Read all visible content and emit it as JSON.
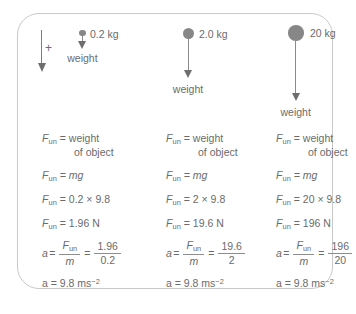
{
  "figure": {
    "direction_key": {
      "positive_symbol": "+"
    },
    "mass_groups": [
      {
        "id": "a",
        "mass_label": "0.2 kg",
        "weight_label": "weight"
      },
      {
        "id": "b",
        "mass_label": "2.0 kg",
        "weight_label": "weight"
      },
      {
        "id": "c",
        "mass_label": "20 kg",
        "weight_label": "weight"
      }
    ],
    "columns": [
      {
        "id": "a",
        "force_word_eq_lhs": "F",
        "force_word_eq_sub": "un",
        "force_word_eq_rhs": "= weight",
        "force_word_eq_rhs2": "of object",
        "formula_rhs": "= mg",
        "substitution_rhs": "= 0.2 × 9.8",
        "result_rhs": "= 1.96 N",
        "accel_lhs": "a",
        "accel_eq1": "=",
        "accel_num1": "F",
        "accel_num1_sub": "un",
        "accel_den1": "m",
        "accel_eq2": "=",
        "accel_num2": "1.96",
        "accel_den2": "0.2",
        "final": "a = 9.8 ms",
        "final_sup": "−2"
      },
      {
        "id": "b",
        "force_word_eq_lhs": "F",
        "force_word_eq_sub": "un",
        "force_word_eq_rhs": "= weight",
        "force_word_eq_rhs2": "of object",
        "formula_rhs": "= mg",
        "substitution_rhs": "= 2 × 9.8",
        "result_rhs": "= 19.6 N",
        "accel_lhs": "a",
        "accel_eq1": "=",
        "accel_num1": "F",
        "accel_num1_sub": "un",
        "accel_den1": "m",
        "accel_eq2": "=",
        "accel_num2": "19.6",
        "accel_den2": "2",
        "final": "a = 9.8 ms",
        "final_sup": "−2"
      },
      {
        "id": "c",
        "force_word_eq_lhs": "F",
        "force_word_eq_sub": "un",
        "force_word_eq_rhs": "= weight",
        "force_word_eq_rhs2": "of object",
        "formula_rhs": "= mg",
        "substitution_rhs": "= 20 × 9.8",
        "result_rhs": "= 196 N",
        "accel_lhs": "a",
        "accel_eq1": "=",
        "accel_num1": "F",
        "accel_num1_sub": "un",
        "accel_den1": "m",
        "accel_eq2": "=",
        "accel_num2": "196",
        "accel_den2": "20",
        "final": "a = 9.8 ms",
        "final_sup": "−2"
      }
    ]
  }
}
